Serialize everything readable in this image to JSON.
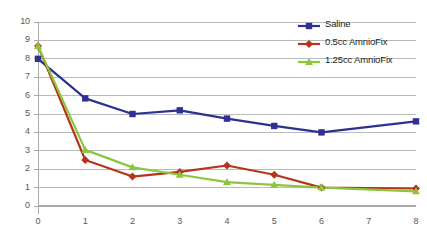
{
  "chart_data": {
    "type": "line",
    "title": "",
    "xlabel": "",
    "ylabel": "",
    "x": [
      0,
      1,
      2,
      3,
      4,
      5,
      6,
      8
    ],
    "xlim": [
      0,
      8
    ],
    "ylim": [
      0,
      10
    ],
    "xticks": [
      "0",
      "1",
      "2",
      "3",
      "4",
      "5",
      "6",
      "7",
      "8"
    ],
    "yticks": [
      "0",
      "1",
      "2",
      "3",
      "4",
      "5",
      "6",
      "7",
      "8",
      "9",
      "10"
    ],
    "grid": true,
    "legend_position": "top-right",
    "series": [
      {
        "name": "Saline",
        "color": "#2e3192",
        "marker": "square",
        "values": [
          8.0,
          5.85,
          5.0,
          5.2,
          4.75,
          4.35,
          4.0,
          4.6
        ]
      },
      {
        "name": "0.5cc AmnioFix",
        "color": "#b5341b",
        "marker": "diamond",
        "values": [
          8.7,
          2.5,
          1.6,
          1.85,
          2.2,
          1.7,
          1.0,
          0.95
        ]
      },
      {
        "name": "1.25cc AmnioFix",
        "color": "#8cc63e",
        "marker": "triangle",
        "values": [
          8.7,
          3.05,
          2.1,
          1.7,
          1.3,
          1.15,
          1.0,
          0.8
        ]
      }
    ]
  },
  "axis": {
    "gridline_color": "#a7a9ac",
    "axis_color": "#a7a9ac",
    "tick_text_color": "#58585a"
  }
}
